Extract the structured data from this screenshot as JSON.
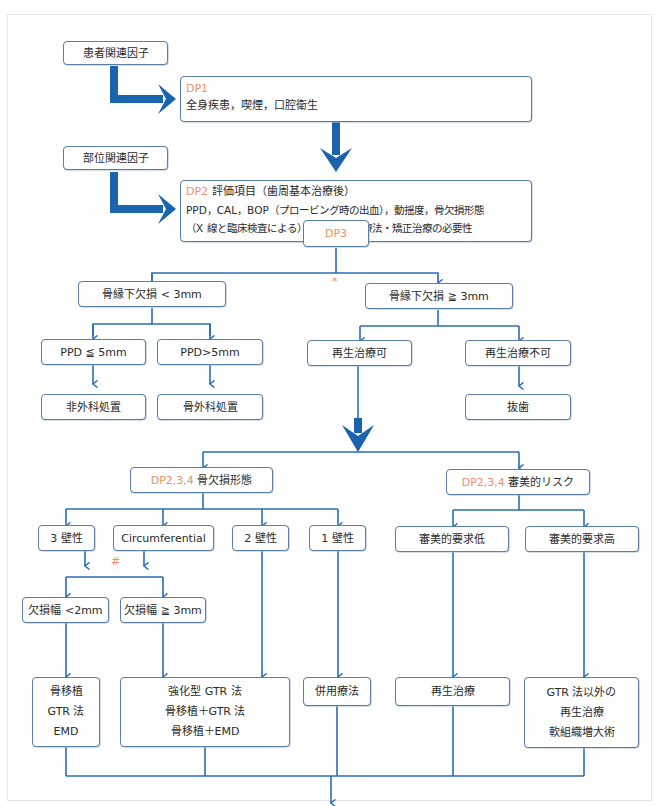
{
  "colors": {
    "line": "#2a6db3",
    "thick_arrow": "#1a63ad",
    "border": "#5a7ea8",
    "dp_label": "#e8916a"
  },
  "factors": {
    "patient": "患者関連因子",
    "site": "部位関連因子"
  },
  "dp1": {
    "label": "DP1",
    "text": "全身疾患，喫煙，口腔衛生"
  },
  "dp2": {
    "label": "DP2",
    "title": "評価項目（歯周基本治療後）",
    "line1": "PPD，CAL，BOP（プロービング時の出血），動揺度，骨欠損形態",
    "line2": "（X 線と臨床検査による），修復・歯内療法・矯正治療の必要性"
  },
  "dp3": {
    "label": "DP3",
    "mark": "*"
  },
  "branch_small": {
    "label": "骨縁下欠損 < 3mm",
    "ppd_low": "PPD ≦ 5mm",
    "ppd_high": "PPD>5mm",
    "nonsurgical": "非外科処置",
    "osseous_surgery": "骨外科処置"
  },
  "branch_large": {
    "label": "骨縁下欠損 ≧ 3mm",
    "regen_ok": "再生治療可",
    "regen_ng": "再生治療不可",
    "extraction": "抜歯"
  },
  "morphology": {
    "dp": "DP2,3,4",
    "label": "骨欠損形態",
    "wall3": "3 壁性",
    "circ": "Circumferential",
    "wall2": "2 壁性",
    "wall1": "1 壁性",
    "mark": "#",
    "width_small": "欠損幅 <2mm",
    "width_large": "欠損幅 ≧ 3mm",
    "treat_a": [
      "骨移植",
      "GTR 法",
      "EMD"
    ],
    "treat_b": [
      "強化型 GTR 法",
      "骨移植＋GTR 法",
      "骨移植＋EMD"
    ],
    "treat_c": "併用療法"
  },
  "esthetic": {
    "dp": "DP2,3,4",
    "label": "審美的リスク",
    "low": "審美的要求低",
    "high": "審美的要求高",
    "treat_low": "再生治療",
    "treat_high": [
      "GTR 法以外の",
      "再生治療",
      "軟組織増大術"
    ]
  },
  "maintenance": "メインテナンス"
}
